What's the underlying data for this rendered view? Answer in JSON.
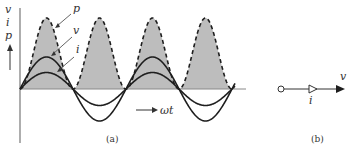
{
  "figure": {
    "panel_a": {
      "caption": "(a)",
      "axis_labels": {
        "y_stack": [
          "v",
          "i",
          "p"
        ],
        "x": "ωt"
      },
      "curves": [
        {
          "name": "p",
          "label": "p",
          "style": "dashed",
          "fill": "#bdbdbd",
          "description": "instantaneous power, sin² shaped, always positive"
        },
        {
          "name": "v",
          "label": "v",
          "style": "solid",
          "description": "voltage sinusoid, larger amplitude"
        },
        {
          "name": "i",
          "label": "i",
          "style": "solid",
          "description": "current sinusoid in phase with v, smaller amplitude"
        }
      ],
      "cycles_shown": 2
    },
    "panel_b": {
      "caption": "(b)",
      "labels": {
        "current": "i",
        "voltage": "v"
      },
      "description": "phasor diagram: current and voltage phasors in phase"
    },
    "colors": {
      "stroke": "#1e1e1e",
      "fill": "#bdbdbd",
      "axis": "#777777"
    }
  }
}
